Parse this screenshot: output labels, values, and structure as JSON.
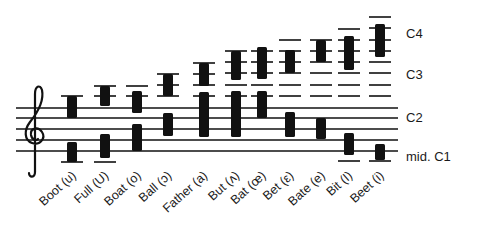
{
  "figure": {
    "title": "",
    "staff_line_y": [
      108,
      118,
      129,
      140,
      151
    ],
    "ledger_line_y": [
      96,
      85,
      73,
      62,
      50,
      39,
      28,
      17
    ],
    "pitch_labels": [
      {
        "text": "C4",
        "y": 34
      },
      {
        "text": "C3",
        "y": 75
      },
      {
        "text": "C2",
        "y": 118
      },
      {
        "text": "mid. C1",
        "y": 157
      }
    ],
    "clef": "treble-clef",
    "ink_color": "#111111"
  },
  "columns": [
    {
      "label": "Boot (u)",
      "x": 72,
      "upper": [
        96,
        118
      ],
      "lower": [
        142,
        162
      ],
      "ledgers": [
        96
      ],
      "below_ledger": 162
    },
    {
      "label": "Full (U)",
      "x": 105,
      "upper": [
        86,
        106
      ],
      "lower": [
        134,
        158
      ],
      "ledgers": [
        86,
        96
      ],
      "below_ledger": 162
    },
    {
      "label": "Boat (o)",
      "x": 137,
      "upper": [
        91,
        113
      ],
      "lower": [
        124,
        151
      ],
      "ledgers": [
        86,
        96
      ],
      "below_ledger": null
    },
    {
      "label": "Ball (ɔ)",
      "x": 168,
      "upper": [
        74,
        96
      ],
      "lower": [
        113,
        136
      ],
      "ledgers": [
        74,
        85,
        96
      ],
      "below_ledger": null
    },
    {
      "label": "Father (a)",
      "x": 204,
      "upper": [
        63,
        86
      ],
      "lower": [
        92,
        137
      ],
      "ledgers": [
        63,
        74,
        85,
        96
      ],
      "below_ledger": null
    },
    {
      "label": "But (ʌ)",
      "x": 236,
      "upper": [
        51,
        80
      ],
      "lower": [
        91,
        137
      ],
      "ledgers": [
        51,
        62,
        73,
        85,
        96
      ],
      "below_ledger": null
    },
    {
      "label": "Bat (œ)",
      "x": 262,
      "upper": [
        47,
        79
      ],
      "lower": [
        91,
        118
      ],
      "ledgers": [
        51,
        62,
        73,
        85,
        96
      ],
      "below_ledger": null
    },
    {
      "label": "Bet (ε)",
      "x": 290,
      "upper": [
        50,
        73
      ],
      "lower": [
        112,
        137
      ],
      "ledgers": [
        40,
        51,
        62,
        73,
        85,
        96
      ],
      "below_ledger": null
    },
    {
      "label": "Bate (e)",
      "x": 321,
      "upper": [
        40,
        62
      ],
      "lower": [
        118,
        139
      ],
      "ledgers": [
        40,
        51,
        62,
        73,
        85,
        96
      ],
      "below_ledger": null
    },
    {
      "label": "Bit (I)",
      "x": 349,
      "upper": [
        36,
        70
      ],
      "lower": [
        133,
        155
      ],
      "ledgers": [
        29,
        40,
        51,
        62,
        73,
        85,
        96
      ],
      "below_ledger": 161
    },
    {
      "label": "Beet (i)",
      "x": 380,
      "upper": [
        24,
        57
      ],
      "lower": [
        144,
        160
      ],
      "ledgers": [
        17,
        28,
        40,
        51,
        62,
        73,
        85,
        96
      ],
      "below_ledger": 161
    }
  ]
}
